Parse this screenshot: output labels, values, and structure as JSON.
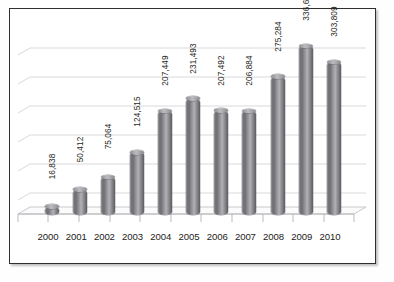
{
  "frame": {
    "border_color": "#2f2f31",
    "background": "#ffffff"
  },
  "chart_data": {
    "type": "bar",
    "title": "",
    "subtitle": "",
    "xlabel": "",
    "ylabel": "",
    "legend": [],
    "legend_position": "none",
    "grid": true,
    "gridlines": 6,
    "style": "3d-cylinder",
    "bar_color": "#8a8a8f",
    "categories": [
      "2000",
      "2001",
      "2002",
      "2003",
      "2004",
      "2005",
      "2006",
      "2007",
      "2008",
      "2009",
      "2010"
    ],
    "values": [
      16838,
      50412,
      75064,
      124515,
      207449,
      231493,
      207492,
      206884,
      275284,
      336655,
      303809
    ],
    "value_labels": [
      "16,838",
      "50,412",
      "75,064",
      "124,515",
      "207,449",
      "231,493",
      "207,492",
      "206,884",
      "275,284",
      "336,655",
      "303,809"
    ],
    "ylim": [
      0,
      350000
    ],
    "axis_tick_labels": []
  }
}
